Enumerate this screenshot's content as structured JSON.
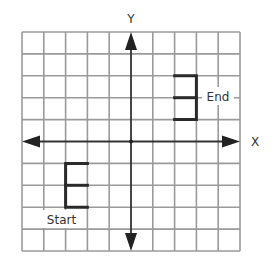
{
  "diagram": {
    "type": "coordinate-grid-transformation",
    "grid": {
      "columns": 10,
      "rows": 10,
      "x_range": [
        -5,
        5
      ],
      "y_range": [
        -5,
        5
      ],
      "line_color": "#9a9a9a",
      "axis_color": "#333333",
      "shape_color": "#2a2a2a"
    },
    "axes": {
      "x_label": "X",
      "y_label": "Y"
    },
    "shapes": [
      {
        "name": "start-shape",
        "label": "Start",
        "description": "E-shaped figure",
        "points": [
          [
            -2,
            -1
          ],
          [
            -3,
            -1
          ],
          [
            -3,
            -3
          ],
          [
            -2,
            -3
          ]
        ],
        "middle_bar": [
          [
            -3,
            -2
          ],
          [
            -2,
            -2
          ]
        ]
      },
      {
        "name": "end-shape",
        "label": "End",
        "description": "Reversed E-shaped figure",
        "points": [
          [
            2,
            3
          ],
          [
            3,
            3
          ],
          [
            3,
            1
          ],
          [
            2,
            1
          ]
        ],
        "middle_bar": [
          [
            2,
            2
          ],
          [
            3,
            2
          ]
        ]
      }
    ],
    "labels": {
      "start": "Start",
      "end": "End"
    }
  }
}
